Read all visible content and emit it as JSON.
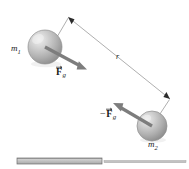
{
  "figure": {
    "background_color": "#ffffff",
    "width": 189,
    "height": 169,
    "labels": {
      "mass1": "m",
      "mass1_subscript": "1",
      "mass2": "m",
      "mass2_subscript": "2",
      "separation": "r",
      "force_on_m1": "F",
      "force_on_m1_subscript": "g",
      "force_on_m2_minus": "−",
      "force_on_m2": "F",
      "force_on_m2_subscript": "g"
    },
    "colors": {
      "sphere_fill": "#b8b8b8",
      "sphere_highlight": "#e8e8e8",
      "sphere_shadow": "#8a8a8a",
      "sphere_outline": "#8f8f8f",
      "force_arrow": "#7d7d7d",
      "measure_line": "#9a9a9a",
      "leader_line": "#9a9a9a",
      "arrowhead_dark": "#2b2b2b",
      "text": "#1a1a1a",
      "bar_fill": "#b5b5b5",
      "bar_edge": "#6e6e6e",
      "rule_line": "#a8a8a8"
    },
    "elements": {
      "sphere1": {
        "cx": 45,
        "cy": 47,
        "r": 17
      },
      "sphere2": {
        "cx": 152,
        "cy": 126,
        "r": 15
      },
      "force_arrow_1": {
        "x1": 45,
        "y1": 47,
        "x2": 84,
        "y2": 68
      },
      "force_arrow_2": {
        "x1": 152,
        "y1": 126,
        "x2": 113,
        "y2": 103
      },
      "measure_arrow": {
        "x1": 68,
        "y1": 17,
        "x2": 170,
        "y2": 99
      },
      "leader_1": {
        "x1": 58,
        "y1": 36,
        "x2": 68,
        "y2": 17
      },
      "leader_2": {
        "x1": 152,
        "y1": 126,
        "x2": 170,
        "y2": 99
      },
      "bar_left": {
        "x": 17,
        "y": 158,
        "width": 85,
        "height": 6
      },
      "rule_right": {
        "x1": 104,
        "y1": 160,
        "x2": 186,
        "y2": 163
      }
    }
  }
}
